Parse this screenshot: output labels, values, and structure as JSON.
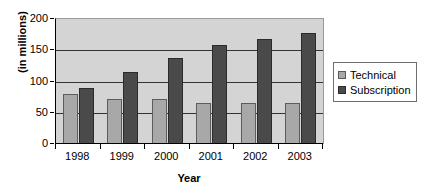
{
  "chart_data": {
    "type": "bar",
    "title": "",
    "subtitle": "",
    "xlabel": "Year",
    "ylabel": "(in millions)",
    "categories": [
      "1998",
      "1999",
      "2000",
      "2001",
      "2002",
      "2003"
    ],
    "series": [
      {
        "name": "Technical",
        "color": "#a8a8a8",
        "values": [
          80,
          72,
          72,
          66,
          66,
          66
        ]
      },
      {
        "name": "Subscription",
        "color": "#4a4a4a",
        "values": [
          90,
          115,
          138,
          158,
          168,
          178
        ]
      }
    ],
    "ylim": [
      0,
      200
    ],
    "ytick_labels": [
      "0",
      "50",
      "100",
      "150",
      "200"
    ],
    "ytick_values": [
      0,
      50,
      100,
      150,
      200
    ],
    "grid": true,
    "grid_axis": "y",
    "legend_position": "right",
    "plot_background": "#d4d4d4",
    "figure_background": "#ffffff"
  },
  "legend": {
    "items": [
      {
        "label": "Technical",
        "swatch": "technical"
      },
      {
        "label": "Subscription",
        "swatch": "subscription"
      }
    ]
  }
}
